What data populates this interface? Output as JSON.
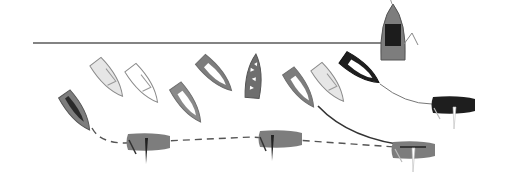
{
  "diagram": {
    "type": "sailing-start-sequence",
    "colors": {
      "background": "#ffffff",
      "line": "#5a5a5a",
      "hull_gray": "#7d7d7d",
      "hull_light": "#e6e6e6",
      "hull_white": "#ffffff",
      "hull_black": "#1e1e1e",
      "outline": "#6e6e6e",
      "sail_dark": "#2a2a2a",
      "committee_cabin": "#1c1c1c"
    },
    "start_line": {
      "x1": 33,
      "y1": 43,
      "x2": 384,
      "y2": 43
    },
    "committee_boat": {
      "cx": 393,
      "cy": 32,
      "length": 56,
      "width": 24,
      "angle": 90
    },
    "boats": [
      {
        "id": "b1",
        "cx": 77,
        "cy": 112,
        "angle": 55,
        "fill": "hull_gray",
        "style": "dark-sail"
      },
      {
        "id": "b2",
        "cx": 109,
        "cy": 79,
        "angle": 52,
        "fill": "hull_light",
        "style": "outline"
      },
      {
        "id": "b3",
        "cx": 144,
        "cy": 85,
        "angle": 52,
        "fill": "hull_white",
        "style": "outline"
      },
      {
        "id": "b4",
        "cx": 188,
        "cy": 104,
        "angle": 55,
        "fill": "hull_gray",
        "style": "window"
      },
      {
        "id": "b5",
        "cx": 216,
        "cy": 75,
        "angle": 45,
        "fill": "hull_gray",
        "style": "window"
      },
      {
        "id": "b6",
        "cx": 254,
        "cy": 76,
        "angle": 95,
        "fill": "hull_gray",
        "style": "dotted"
      },
      {
        "id": "b7",
        "cx": 301,
        "cy": 89,
        "angle": 55,
        "fill": "hull_gray",
        "style": "window"
      },
      {
        "id": "b8",
        "cx": 330,
        "cy": 84,
        "angle": 52,
        "fill": "hull_light",
        "style": "outline"
      },
      {
        "id": "b9",
        "cx": 361,
        "cy": 70,
        "angle": 35,
        "fill": "hull_black",
        "style": "window"
      },
      {
        "id": "b10",
        "cx": 454,
        "cy": 105,
        "angle": 0,
        "fill": "hull_black",
        "style": "reaching"
      },
      {
        "id": "b11",
        "cx": 149,
        "cy": 142,
        "angle": 0,
        "fill": "hull_gray",
        "style": "reaching-dark"
      },
      {
        "id": "b12",
        "cx": 281,
        "cy": 139,
        "angle": 0,
        "fill": "hull_gray",
        "style": "reaching-dark"
      },
      {
        "id": "b13",
        "cx": 414,
        "cy": 150,
        "angle": 0,
        "fill": "hull_gray",
        "style": "reaching"
      }
    ],
    "paths": [
      {
        "id": "dashed-track",
        "style": "dashed",
        "d": "M92 128 Q100 143 125 143 L 164 141 L 252 137 L 395 147"
      },
      {
        "id": "curve-b9-b10",
        "style": "thin",
        "d": "M380 84 Q405 104 432 104"
      },
      {
        "id": "curve-b7-b13",
        "style": "solid",
        "d": "M318 106 Q350 140 412 146"
      }
    ]
  }
}
